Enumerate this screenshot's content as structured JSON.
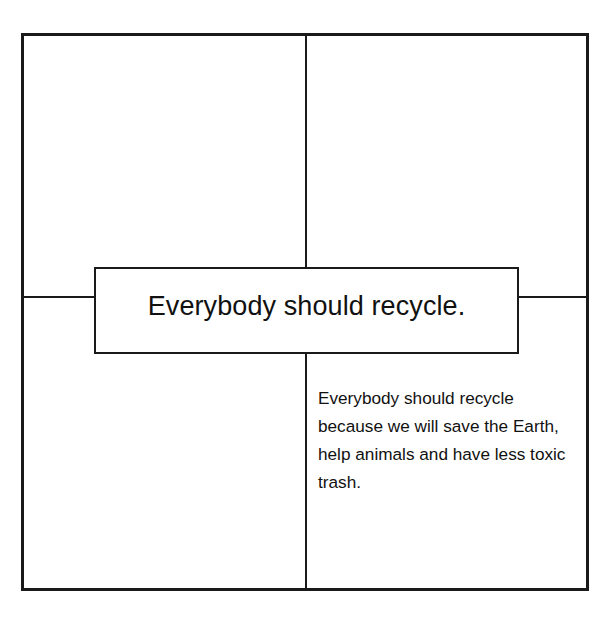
{
  "diagram": {
    "type": "four-square graphic organizer",
    "main_idea": "Everybody should recycle.",
    "quadrants": {
      "top_left": "",
      "top_right": "",
      "bottom_left": "",
      "bottom_right": "Everybody should recycle because we will save the Earth, help animals and have less toxic trash."
    },
    "colors": {
      "background": "#ffffff",
      "lines": "#1a1a1a",
      "text": "#111111"
    }
  }
}
